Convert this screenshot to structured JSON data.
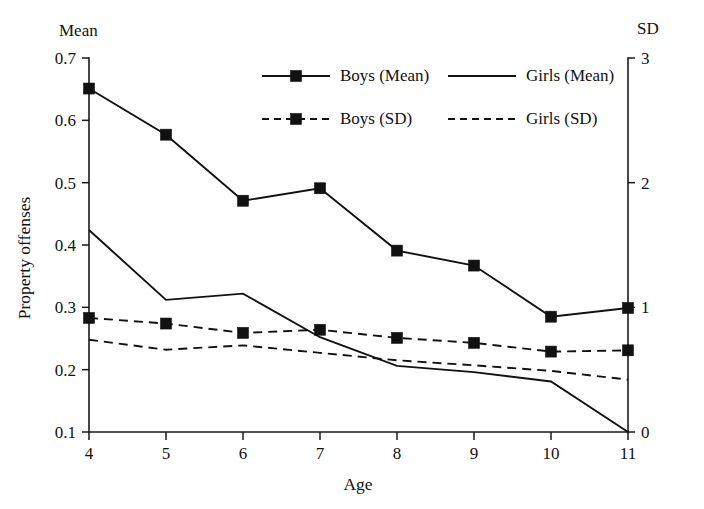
{
  "figure": {
    "background": "#ffffff",
    "ink_color": "#111111",
    "left_axis_header": "Mean",
    "right_axis_header": "SD",
    "y_axis_title": "Property offenses",
    "x_axis_title": "Age"
  },
  "chart_data": {
    "type": "line",
    "title": "",
    "subtitle": "",
    "xlabel": "Age",
    "ylabel": "Property offenses",
    "y2label": "SD",
    "left_axis_header": "Mean",
    "right_axis_header": "SD",
    "grid": false,
    "legend_position": "top-center",
    "x": [
      4,
      5,
      6,
      7,
      8,
      9,
      10,
      11
    ],
    "categories": [
      "4",
      "5",
      "6",
      "7",
      "8",
      "9",
      "10",
      "11"
    ],
    "xlim": [
      4,
      11
    ],
    "ylim": [
      0.1,
      0.7
    ],
    "y2lim": [
      0,
      3
    ],
    "xticks": [
      4,
      5,
      6,
      7,
      8,
      9,
      10,
      11
    ],
    "xticklabels": [
      "4",
      "5",
      "6",
      "7",
      "8",
      "9",
      "10",
      "11"
    ],
    "yticks": [
      0.1,
      0.2,
      0.3,
      0.4,
      0.5,
      0.6,
      0.7
    ],
    "yticklabels": [
      "0.1",
      "0.2",
      "0.3",
      "0.4",
      "0.5",
      "0.6",
      "0.7"
    ],
    "y2ticks": [
      0,
      1,
      2,
      3
    ],
    "y2ticklabels": [
      "0",
      "1",
      "2",
      "3"
    ],
    "series": [
      {
        "name": "Boys (Mean)",
        "axis": "left",
        "style": "solid",
        "marker": "square",
        "values": [
          0.651,
          0.577,
          0.471,
          0.491,
          0.391,
          0.367,
          0.285,
          0.299
        ]
      },
      {
        "name": "Girls (Mean)",
        "axis": "left",
        "style": "solid",
        "marker": "none",
        "values": [
          0.424,
          0.312,
          0.322,
          0.252,
          0.206,
          0.196,
          0.181,
          0.1
        ]
      },
      {
        "name": "Boys (SD)",
        "axis": "left",
        "style": "dashed",
        "marker": "square",
        "values": [
          0.283,
          0.274,
          0.259,
          0.264,
          0.251,
          0.243,
          0.229,
          0.231
        ]
      },
      {
        "name": "Girls (SD)",
        "axis": "left",
        "style": "dashed",
        "marker": "none",
        "values": [
          0.248,
          0.232,
          0.239,
          0.227,
          0.215,
          0.207,
          0.198,
          0.184
        ]
      }
    ],
    "legend": [
      {
        "label": "Boys (Mean)",
        "style": "solid",
        "marker": "square"
      },
      {
        "label": "Girls (Mean)",
        "style": "solid",
        "marker": "none"
      },
      {
        "label": "Boys (SD)",
        "style": "dashed",
        "marker": "square"
      },
      {
        "label": "Girls (SD)",
        "style": "dashed",
        "marker": "none"
      }
    ]
  },
  "geometry": {
    "plot_left": 89,
    "plot_right": 628,
    "plot_top": 58,
    "plot_bottom": 432,
    "marker_size": 11,
    "legend": {
      "rows": [
        {
          "y": 81,
          "items": [
            {
              "key": 0,
              "line_x1": 262,
              "line_x2": 330,
              "text_x": 340
            },
            {
              "key": 1,
              "line_x1": 448,
              "line_x2": 516,
              "text_x": 526
            }
          ]
        },
        {
          "y": 124,
          "items": [
            {
              "key": 2,
              "line_x1": 262,
              "line_x2": 330,
              "text_x": 340
            },
            {
              "key": 3,
              "line_x1": 448,
              "line_x2": 516,
              "text_x": 526
            }
          ]
        }
      ]
    }
  }
}
